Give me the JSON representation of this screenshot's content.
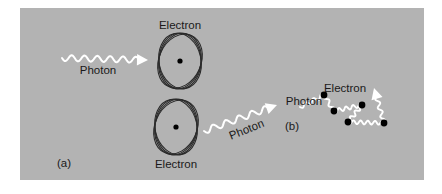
{
  "figure": {
    "background_color": "#ffffff",
    "panel_color": "#b3b3b3",
    "panel_rect": {
      "x": 20,
      "y": 8,
      "width": 404,
      "height": 172
    },
    "ink_color": "#1a1a1a",
    "photon_color": "#ffffff",
    "electron_color": "#000000"
  },
  "panels": [
    {
      "id": "a",
      "label": "(a)",
      "label_pos": {
        "x": 57,
        "y": 167
      },
      "description": "Photon absorbed by an atom and re-emitted by another atom"
    },
    {
      "id": "b",
      "label": "(b)",
      "label_pos": {
        "x": 285,
        "y": 130
      },
      "description": "Photon scattering in a zigzag path off free electrons"
    }
  ],
  "labels": {
    "electron_top": "Electron",
    "photon_in": "Photon",
    "electron_bottom": "Electron",
    "photon_out": "Photon",
    "electron_b": "Electron",
    "photon_b": "Photon"
  },
  "atoms": [
    {
      "name": "atom-top",
      "center": {
        "x": 180,
        "y": 61
      },
      "rx": 21,
      "ry": 28,
      "orbit_rotations": [
        0,
        12,
        -12,
        24
      ],
      "nucleus_radius": 2.6,
      "label": "Electron",
      "label_pos": {
        "x": 180,
        "y": 29
      }
    },
    {
      "name": "atom-bottom",
      "center": {
        "x": 176,
        "y": 127
      },
      "rx": 21,
      "ry": 28,
      "orbit_rotations": [
        0,
        12,
        -12,
        24
      ],
      "nucleus_radius": 2.6,
      "label": "Electron",
      "label_pos": {
        "x": 176,
        "y": 168
      }
    }
  ],
  "photons": [
    {
      "name": "photon-incoming",
      "label": "Photon",
      "label_pos": {
        "x": 98,
        "y": 74
      },
      "start": {
        "x": 62,
        "y": 58
      },
      "end": {
        "x": 148,
        "y": 60
      },
      "direction": "right",
      "amplitude": 3.0,
      "cycles": 6
    },
    {
      "name": "photon-outgoing",
      "label": "Photon",
      "label_pos": {
        "x": 248,
        "y": 133
      },
      "label_rotation": -22,
      "start": {
        "x": 204,
        "y": 131
      },
      "end": {
        "x": 277,
        "y": 105
      },
      "direction": "up-right",
      "amplitude": 3.0,
      "cycles": 5
    }
  ],
  "scatter": {
    "name": "photon-scatter-path",
    "electron_label": "Electron",
    "electron_label_pos": {
      "x": 345,
      "y": 92
    },
    "photon_label": "Photon",
    "photon_label_pos": {
      "x": 304,
      "y": 105
    },
    "electrons": [
      {
        "x": 324,
        "y": 95
      },
      {
        "x": 334,
        "y": 111
      },
      {
        "x": 362,
        "y": 105
      },
      {
        "x": 348,
        "y": 122
      },
      {
        "x": 384,
        "y": 123
      }
    ],
    "arrow_tip": {
      "x": 374,
      "y": 88
    },
    "path_nodes": [
      {
        "x": 300,
        "y": 107
      },
      {
        "x": 324,
        "y": 95
      },
      {
        "x": 334,
        "y": 111
      },
      {
        "x": 362,
        "y": 105
      },
      {
        "x": 348,
        "y": 122
      },
      {
        "x": 384,
        "y": 123
      },
      {
        "x": 374,
        "y": 88
      }
    ]
  }
}
